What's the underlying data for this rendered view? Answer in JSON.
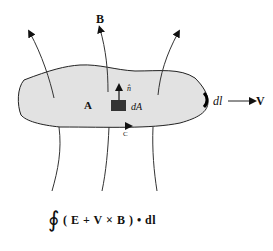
{
  "diagram": {
    "labels": {
      "field": "B",
      "area": "A",
      "normal": "n̂",
      "area_element": "dA",
      "contour": "C",
      "line_element": "dl",
      "velocity": "V"
    },
    "formula": {
      "integral_symbol": "∮",
      "expression": "( E + V × B ) • dl",
      "parts": [
        "(",
        "E",
        "+",
        "V",
        "×",
        "B",
        ")",
        "•",
        "dl"
      ]
    },
    "colors": {
      "surface_fill": "#e2e2e2",
      "stroke": "#222222",
      "background": "#ffffff"
    }
  }
}
